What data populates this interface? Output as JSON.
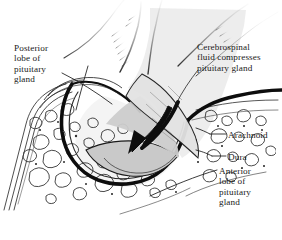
{
  "figure": {
    "background_color": "#ffffff",
    "ink_color": "#1a1a1a",
    "gland_fill_color": "#cfcfcf",
    "csf_fill_color": "#ebebeb",
    "bone_fill_color": "#ffffff"
  },
  "labels": {
    "posterior_lobe": "Posterior\nlobe of\npituitary\ngland",
    "cerebrospinal_fluid": "Cerebrospinal\nfluid compresses\npituitary gland",
    "arachnoid": "Arachnoid",
    "dura": "Dura",
    "anterior_lobe": "Anterior\nlobe of\npituitary\ngland"
  },
  "structures": {
    "sphenoid_bone": "trabecular-bone-texture",
    "sella_turcica": "sella-turcica-cavity",
    "pituitary_stalk": "infundibulum",
    "compression_arrow": "downward-pressure-arrow",
    "dura_line": "thick-dura-mater-outline"
  }
}
